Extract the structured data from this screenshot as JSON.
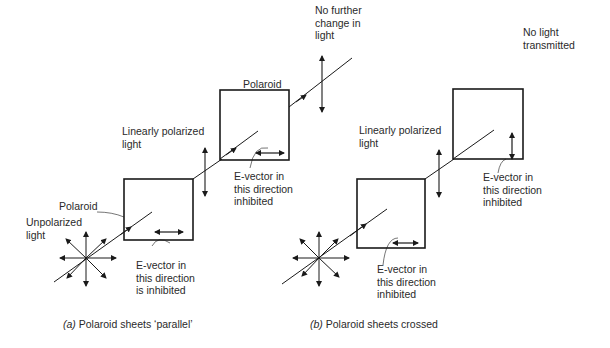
{
  "diagram_a": {
    "caption_letter": "(a)",
    "caption_text": " Polaroid sheets ‘parallel’",
    "labels": {
      "unpolarized": "Unpolarized\nlight",
      "polaroid_1": "Polaroid",
      "linearly_polarized": "Linearly polarized\nlight",
      "polaroid_2": "Polaroid",
      "no_further_change": "No further\nchange in\nlight",
      "evector_1": "E-vector in\nthis direction\nis inhibited",
      "evector_2": "E-vector in\nthis direction\ninhibited"
    }
  },
  "diagram_b": {
    "caption_letter": "(b)",
    "caption_text": " Polaroid sheets crossed",
    "labels": {
      "linearly_polarized": "Linearly polarized\nlight",
      "no_light": "No light\ntransmitted",
      "evector_1": "E-vector in\nthis direction\ninhibited",
      "evector_2": "E-vector in\nthis direction\ninhibited"
    }
  },
  "colors": {
    "line": "#1a1a1a",
    "text": "#2a2a2a",
    "background": "#ffffff"
  }
}
